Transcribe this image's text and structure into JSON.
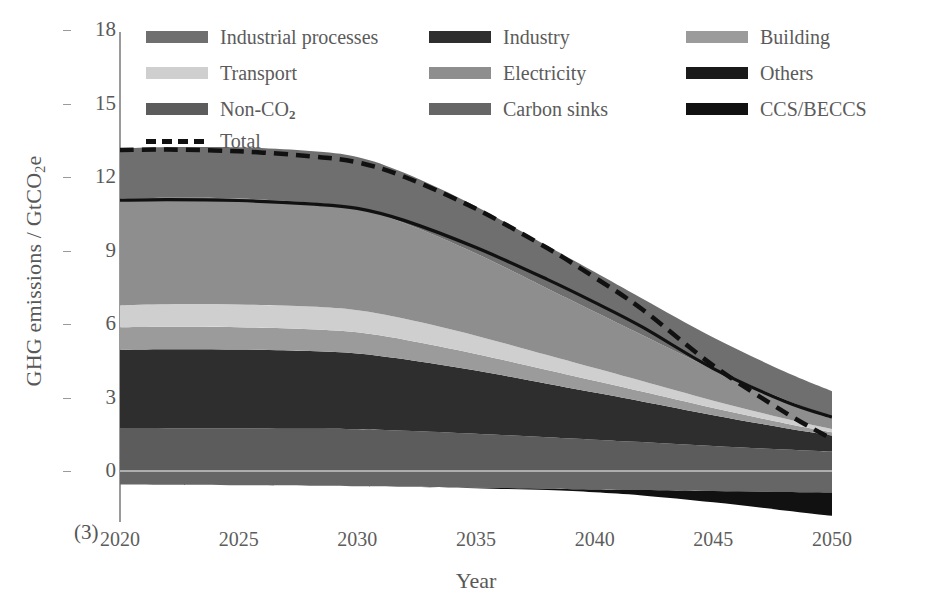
{
  "figure": {
    "panel_tag": "(3)",
    "xlabel": "Year",
    "ylabel_prefix": "GHG emissions / GtCO",
    "ylabel_sub": "2",
    "ylabel_suffix": "e"
  },
  "legend": {
    "items": [
      {
        "label": "Industrial processes",
        "color": "#6f6f6f",
        "type": "swatch",
        "col": 0,
        "row": 0
      },
      {
        "label": "Industry",
        "color": "#2e2e2e",
        "type": "swatch",
        "col": 1,
        "row": 0
      },
      {
        "label": "Building",
        "color": "#9b9b9b",
        "type": "swatch",
        "col": 2,
        "row": 0
      },
      {
        "label": "Transport",
        "color": "#cfcfcf",
        "type": "swatch",
        "col": 0,
        "row": 1
      },
      {
        "label": "Electricity",
        "color": "#8e8e8e",
        "type": "swatch",
        "col": 1,
        "row": 1
      },
      {
        "label": "Others",
        "color": "#1a1a1a",
        "type": "swatch",
        "col": 2,
        "row": 1
      },
      {
        "label": "Non-CO",
        "sub": "2",
        "color": "#5c5c5c",
        "type": "swatch",
        "col": 0,
        "row": 2
      },
      {
        "label": "Carbon sinks",
        "color": "#666666",
        "type": "swatch",
        "col": 1,
        "row": 2
      },
      {
        "label": "CCS/BECCS",
        "color": "#111111",
        "type": "swatch",
        "col": 2,
        "row": 2
      },
      {
        "label": "Total",
        "color": "#111111",
        "type": "dash",
        "col": 0,
        "row": 3
      }
    ]
  },
  "chart_data": {
    "type": "area",
    "stacked": true,
    "title": "",
    "xlabel": "Year",
    "ylabel": "GHG emissions / GtCO2e",
    "xlim": [
      2020,
      2050
    ],
    "ylim": [
      -2,
      18
    ],
    "yticks": [
      0,
      3,
      6,
      9,
      12,
      15,
      18
    ],
    "xticks": [
      2020,
      2025,
      2030,
      2035,
      2040,
      2045,
      2050
    ],
    "grid": false,
    "legend_position": "top",
    "x": [
      2020,
      2022,
      2025,
      2028,
      2030,
      2032,
      2035,
      2038,
      2040,
      2042,
      2045,
      2048,
      2050
    ],
    "series": [
      {
        "name": "Non-CO2",
        "color": "#5c5c5c",
        "values": [
          1.75,
          1.75,
          1.74,
          1.72,
          1.7,
          1.64,
          1.52,
          1.38,
          1.28,
          1.18,
          1.02,
          0.88,
          0.8
        ]
      },
      {
        "name": "Industry",
        "color": "#2e2e2e",
        "values": [
          3.2,
          3.22,
          3.22,
          3.18,
          3.1,
          2.92,
          2.58,
          2.18,
          1.92,
          1.66,
          1.26,
          0.88,
          0.65
        ]
      },
      {
        "name": "Building",
        "color": "#9b9b9b",
        "values": [
          0.92,
          0.92,
          0.91,
          0.89,
          0.86,
          0.8,
          0.68,
          0.56,
          0.48,
          0.4,
          0.29,
          0.19,
          0.13
        ]
      },
      {
        "name": "Transport",
        "color": "#cfcfcf",
        "values": [
          0.9,
          0.92,
          0.93,
          0.92,
          0.9,
          0.85,
          0.74,
          0.61,
          0.52,
          0.43,
          0.3,
          0.19,
          0.13
        ]
      },
      {
        "name": "Electricity",
        "color": "#8e8e8e",
        "values": [
          4.33,
          4.34,
          4.32,
          4.25,
          4.16,
          3.9,
          3.36,
          2.72,
          2.3,
          1.88,
          1.28,
          0.78,
          0.5
        ]
      },
      {
        "name": "Industrial processes",
        "color": "#6f6f6f",
        "values": [
          2.05,
          2.07,
          2.09,
          2.1,
          2.1,
          2.05,
          1.92,
          1.74,
          1.62,
          1.49,
          1.3,
          1.14,
          1.05
        ]
      },
      {
        "name": "Carbon sinks",
        "color": "#666666",
        "values": [
          -0.55,
          -0.56,
          -0.58,
          -0.6,
          -0.62,
          -0.64,
          -0.68,
          -0.72,
          -0.75,
          -0.78,
          -0.82,
          -0.86,
          -0.88
        ]
      },
      {
        "name": "CCS/BECCS",
        "color": "#111111",
        "values": [
          0.0,
          0.0,
          0.0,
          0.0,
          0.0,
          0.0,
          -0.02,
          -0.06,
          -0.12,
          -0.22,
          -0.46,
          -0.75,
          -0.95
        ]
      }
    ],
    "lines": [
      {
        "name": "Total",
        "style": "dashed",
        "color": "#111111",
        "values": [
          13.1,
          13.12,
          13.05,
          12.85,
          12.6,
          12.0,
          10.7,
          9.1,
          7.9,
          6.6,
          4.3,
          2.4,
          1.3
        ]
      },
      {
        "name": "Gross positive total",
        "style": "solid",
        "color": "#111111",
        "values": [
          11.05,
          11.08,
          11.04,
          10.9,
          10.72,
          10.22,
          9.12,
          7.82,
          6.88,
          5.88,
          4.18,
          2.85,
          2.2
        ]
      }
    ]
  }
}
